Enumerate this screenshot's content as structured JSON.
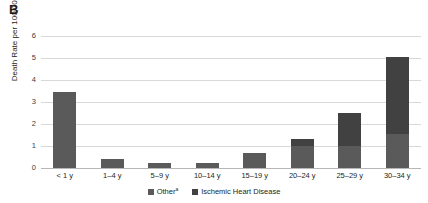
{
  "panel": {
    "label": "B"
  },
  "legend": {
    "position": "bottom-center",
    "items": [
      {
        "label": "Other",
        "superscript": "a",
        "color": "#5a5a5a",
        "name": "other"
      },
      {
        "label": "Ischemic Heart Disease",
        "superscript": "",
        "color": "#414141",
        "name": "ischemic-heart-disease"
      }
    ]
  },
  "axis": {
    "ylabel": "Death Rate per 100,000",
    "yticks": [
      "0",
      "1",
      "2",
      "3",
      "4",
      "5",
      "6"
    ]
  },
  "chart_data": {
    "type": "bar",
    "subtype": "stacked-vertical",
    "title": "B",
    "xlabel": "",
    "ylabel": "Death Rate per 100,000",
    "ylim": [
      0,
      6
    ],
    "ytick_values": [
      0,
      1,
      2,
      3,
      4,
      5,
      6
    ],
    "grid": true,
    "legend_position": "bottom-center",
    "categories": [
      "< 1 y",
      "1–4 y",
      "5–9 y",
      "10–14 y",
      "15–19 y",
      "20–24 y",
      "25–29 y",
      "30–34 y"
    ],
    "series": [
      {
        "name": "Other",
        "color": "#5a5a5a",
        "values": [
          3.45,
          0.4,
          0.25,
          0.25,
          0.7,
          1.0,
          1.0,
          1.55
        ]
      },
      {
        "name": "Ischemic Heart Disease",
        "color": "#414141",
        "values": [
          0.0,
          0.0,
          0.0,
          0.0,
          0.0,
          0.3,
          1.5,
          3.5
        ]
      }
    ],
    "totals": [
      3.45,
      0.4,
      0.25,
      0.25,
      0.7,
      1.3,
      2.5,
      5.05
    ]
  }
}
